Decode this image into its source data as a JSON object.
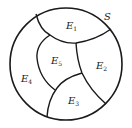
{
  "diagram": {
    "sample_space": {
      "label": "S"
    },
    "regions": [
      {
        "id": "E1",
        "letter": "E",
        "sub": "1"
      },
      {
        "id": "E2",
        "letter": "E",
        "sub": "2"
      },
      {
        "id": "E3",
        "letter": "E",
        "sub": "3"
      },
      {
        "id": "E4",
        "letter": "E",
        "sub": "4"
      },
      {
        "id": "E5",
        "letter": "E",
        "sub": "5"
      }
    ],
    "stroke_color": "#1a1a1a",
    "background_color": "#ffffff"
  }
}
